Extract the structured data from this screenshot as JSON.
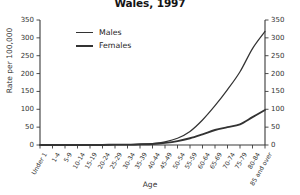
{
  "chart_title": "Wales, 1997",
  "axis": {
    "xlabel": "Age",
    "ylabel_left": "Rate per 100,000"
  },
  "legend": {
    "males_label": "Males",
    "females_label": "Females"
  },
  "chart_data": {
    "type": "line",
    "title": "Wales, 1997",
    "xlabel": "Age",
    "ylabel": "Rate per 100,000",
    "ylim": [
      0,
      350
    ],
    "yticks": [
      0,
      50,
      100,
      150,
      200,
      250,
      300,
      350
    ],
    "yticks_right": [
      0,
      50,
      100,
      150,
      200,
      250,
      300,
      350
    ],
    "grid": false,
    "legend_position": "upper-left-inside",
    "dual_y_axis": true,
    "categories": [
      "Under 1",
      "1-4",
      "5-9",
      "10-14",
      "15-19",
      "20-24",
      "25-29",
      "30-34",
      "35-39",
      "40-44",
      "45-49",
      "50-54",
      "55-59",
      "60-64",
      "65-69",
      "70-74",
      "75-79",
      "80-84",
      "85 and over"
    ],
    "series": [
      {
        "name": "Males",
        "values": [
          0,
          0,
          0,
          0,
          0,
          0,
          1,
          1,
          2,
          4,
          9,
          19,
          38,
          70,
          110,
          155,
          205,
          270,
          318
        ]
      },
      {
        "name": "Females",
        "values": [
          0,
          0,
          0,
          0,
          0,
          0,
          1,
          1,
          2,
          3,
          6,
          11,
          19,
          30,
          42,
          50,
          58,
          78,
          98
        ]
      }
    ]
  }
}
